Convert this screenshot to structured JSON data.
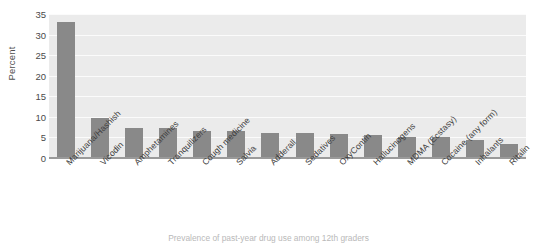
{
  "chart_data": {
    "type": "bar",
    "title": "",
    "xlabel": "",
    "ylabel": "Percent",
    "ylim": [
      0,
      35
    ],
    "yticks": [
      0,
      5,
      10,
      15,
      20,
      25,
      30,
      35
    ],
    "grid": true,
    "legend": null,
    "orientation": "vertical",
    "bar_color": "#898989",
    "plot_background": "#ebebeb",
    "gridline_color": "#fbfbfb",
    "categories": [
      "Marijuana/Hashish",
      "Vicodin",
      "Amphetamines",
      "Tranquilizers",
      "Cough medicine",
      "Salvia",
      "Adderall",
      "Sedatives",
      "OxyContin",
      "Hallucinogens",
      "MDMA (Ecstasy)",
      "Cocaine (any form)",
      "Inhalants",
      "Ritalin"
    ],
    "values": [
      33.0,
      9.7,
      7.3,
      7.2,
      6.6,
      6.5,
      6.2,
      6.0,
      5.9,
      5.5,
      5.2,
      5.0,
      4.5,
      3.5
    ]
  },
  "axes": {
    "y_title": "Percent",
    "y_tick_labels": [
      "0",
      "5",
      "10",
      "15",
      "20",
      "25",
      "30",
      "35"
    ]
  },
  "caption": {
    "text": "Prevalence of past-year drug use among 12th graders"
  }
}
